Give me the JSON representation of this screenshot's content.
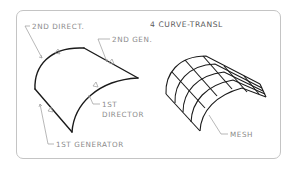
{
  "title": "4 CURVE-TRANSL",
  "labels": {
    "second_director": "2ND DIRECT.",
    "second_generator": "2ND GEN.",
    "first_director_line1": "1ST",
    "first_director_line2": "DIRECTOR",
    "first_generator": "1ST GENERATOR",
    "mesh": "MESH"
  },
  "figures": {
    "left": "curve-defined translational surface outline",
    "right": "resulting surface mesh (5 x 6 grid)"
  },
  "colors": {
    "curve": "#1a1a1a",
    "leader": "#9a9a9a",
    "text": "#8a8a8a",
    "frame": "#c4c4c4"
  }
}
